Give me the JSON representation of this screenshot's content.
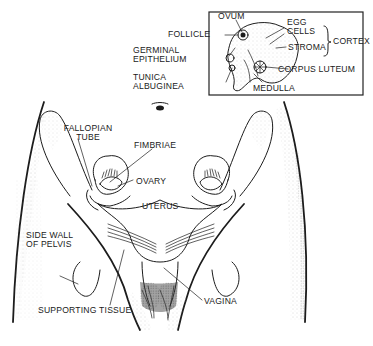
{
  "figure": {
    "type": "anatomical line drawing",
    "colors": {
      "ink": "#1c1c1c",
      "background": "#ffffff",
      "stipple": "#9a9a9a"
    }
  },
  "inset": {
    "title": "Ovary cross-section",
    "labels": {
      "ovum": "OVUM",
      "follicle": "FOLLICLE",
      "germinal_epithelium_1": "GERMINAL",
      "germinal_epithelium_2": "EPITHELIUM",
      "tunica_albuginea_1": "TUNICA",
      "tunica_albuginea_2": "ALBUGINEA",
      "egg_cells_1": "EGG",
      "egg_cells_2": "CELLS",
      "stroma": "STROMA",
      "cortex": "CORTEX",
      "corpus_luteum": "CORPUS LUTEUM",
      "medulla": "MEDULLA"
    },
    "bracket_group": {
      "label": "CORTEX",
      "members": [
        "EGG CELLS",
        "STROMA"
      ]
    }
  },
  "main": {
    "labels": {
      "fallopian_tube_1": "FALLOPIAN",
      "fallopian_tube_2": "TUBE",
      "fimbriae": "FIMBRIAE",
      "ovary": "OVARY",
      "uterus": "UTERUS",
      "side_wall_1": "SIDE WALL",
      "side_wall_2": "OF PELVIS",
      "supporting_tissue": "SUPPORTING TISSUE",
      "vagina": "VAGINA"
    },
    "navel_symbol": "navel"
  }
}
